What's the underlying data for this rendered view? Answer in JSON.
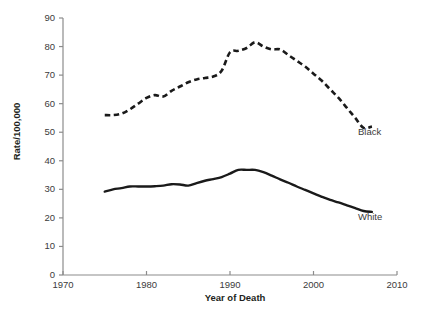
{
  "chart_data": {
    "type": "line",
    "title": "",
    "subtitle": "",
    "xlabel": "Year of Death",
    "ylabel": "Rate/100,000",
    "xlim": [
      1970,
      2010
    ],
    "ylim": [
      0,
      90
    ],
    "xticks": [
      1970,
      1980,
      1990,
      2000,
      2010
    ],
    "yticks": [
      0,
      10,
      20,
      30,
      40,
      50,
      60,
      70,
      80,
      90
    ],
    "grid": false,
    "legend_position": "inline-right-end-labels",
    "series": [
      {
        "name": "Black",
        "style": "dashed",
        "color": "#1a1a1a",
        "x": [
          1975,
          1976,
          1977,
          1978,
          1979,
          1980,
          1981,
          1982,
          1983,
          1984,
          1985,
          1986,
          1987,
          1988,
          1989,
          1990,
          1991,
          1992,
          1993,
          1994,
          1995,
          1996,
          1997,
          1998,
          1999,
          2000,
          2001,
          2002,
          2003,
          2004,
          2005,
          2006,
          2007
        ],
        "values": [
          56,
          56,
          56.5,
          58,
          60,
          62,
          63,
          62.5,
          64.5,
          66,
          67.5,
          68.5,
          69,
          69.5,
          71.5,
          78,
          78.5,
          79.5,
          81.5,
          80,
          79,
          79,
          77,
          75,
          73,
          70.5,
          68,
          65,
          62,
          58.5,
          55,
          51.5,
          52
        ]
      },
      {
        "name": "White",
        "style": "solid",
        "color": "#1a1a1a",
        "x": [
          1975,
          1976,
          1977,
          1978,
          1979,
          1980,
          1981,
          1982,
          1983,
          1984,
          1985,
          1986,
          1987,
          1988,
          1989,
          1990,
          1991,
          1992,
          1993,
          1994,
          1995,
          1996,
          1997,
          1998,
          1999,
          2000,
          2001,
          2002,
          2003,
          2004,
          2005,
          2006,
          2007
        ],
        "values": [
          29.2,
          30,
          30.4,
          31,
          31,
          31,
          31.1,
          31.3,
          31.8,
          31.7,
          31.3,
          32.2,
          33,
          33.6,
          34.3,
          35.5,
          36.8,
          36.8,
          36.8,
          36,
          34.8,
          33.5,
          32.3,
          31,
          29.8,
          28.6,
          27.4,
          26.3,
          25.4,
          24.4,
          23.4,
          22.4,
          22.1
        ]
      }
    ],
    "annotations": [
      {
        "text": "Black",
        "x": 2004,
        "y": 51
      },
      {
        "text": "White",
        "x": 2004,
        "y": 21
      }
    ]
  },
  "axes": {
    "y_tick_labels": [
      "90",
      "80",
      "70",
      "60",
      "50",
      "40",
      "30",
      "20",
      "10",
      "0"
    ],
    "x_tick_labels": [
      "1970",
      "1980",
      "1990",
      "2000",
      "2010"
    ],
    "y_title": "Rate/100,000",
    "x_title": "Year of Death"
  },
  "labels": {
    "black": "Black",
    "white": "White"
  },
  "colors": {
    "line": "#1a1a1a",
    "axis": "#8c8c8c",
    "text": "#231f20",
    "background": "#ffffff"
  }
}
